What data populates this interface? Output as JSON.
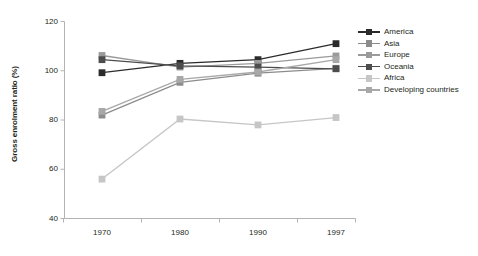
{
  "chart_data": {
    "type": "line",
    "title": "",
    "xlabel": "",
    "ylabel": "Gross enrolment ratio (%)",
    "categories": [
      "1970",
      "1980",
      "1990",
      "1997"
    ],
    "x_tick_labels": [
      "1970",
      "1980",
      "1990",
      "1997"
    ],
    "y_tick_labels": [
      "40",
      "60",
      "80",
      "100",
      "120"
    ],
    "y_ticks": [
      40,
      60,
      80,
      100,
      120
    ],
    "ylim": [
      40,
      120
    ],
    "grid": false,
    "legend_position": "right",
    "series": [
      {
        "name": "America",
        "values": [
          99.2,
          103.0,
          104.5,
          111.0
        ],
        "color": "#2b2b2b"
      },
      {
        "name": "Asia",
        "values": [
          82.0,
          95.3,
          99.0,
          101.0
        ],
        "color": "#8c8c8c"
      },
      {
        "name": "Europe",
        "values": [
          106.2,
          101.5,
          103.0,
          106.0
        ],
        "color": "#9a9a9a"
      },
      {
        "name": "Oceania",
        "values": [
          104.5,
          102.0,
          101.5,
          100.8
        ],
        "color": "#4d4d4d"
      },
      {
        "name": "Africa",
        "values": [
          56.0,
          80.4,
          78.0,
          81.0
        ],
        "color": "#c6c6c6"
      },
      {
        "name": "Developing countries",
        "values": [
          83.5,
          96.5,
          99.5,
          104.5
        ],
        "color": "#a8a8a8"
      }
    ]
  },
  "legend": {
    "items": [
      {
        "label": "America"
      },
      {
        "label": "Asia"
      },
      {
        "label": "Europe"
      },
      {
        "label": "Oceania"
      },
      {
        "label": "Africa"
      },
      {
        "label": "Developing countries"
      }
    ]
  },
  "axes": {
    "axis_color": "#b3b3b3"
  }
}
